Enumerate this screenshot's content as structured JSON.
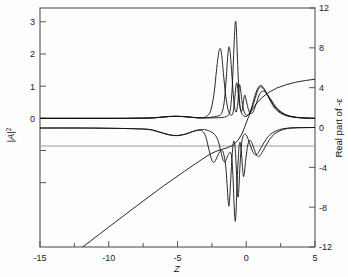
{
  "figure": {
    "background": "#fdfdfd",
    "frame_color": "#555555",
    "curve_color": "#111111",
    "zero_line_color": "#888888"
  },
  "chart_data": {
    "type": "line",
    "title": "",
    "xlabel": "Z",
    "ylabel": "|A|²",
    "y2label": "Real part of -ε",
    "xlim": [
      -15,
      5
    ],
    "ylim": [
      -4,
      3.43
    ],
    "y2lim": [
      -12,
      12
    ],
    "grid": false,
    "legend": "none",
    "xticks": [
      -15,
      -10,
      -5,
      0,
      5
    ],
    "xtick_labels": [
      "-15",
      "-10",
      "-5",
      "0",
      "5"
    ],
    "x_minor_ticks": [
      -12.5,
      -7.5,
      -2.5,
      2.5
    ],
    "yticks": [
      0,
      1,
      2,
      3
    ],
    "ytick_labels": [
      "0",
      "1",
      "2",
      "3"
    ],
    "y_minor_ticks": [
      -1,
      -2
    ],
    "y2ticks": [
      -12,
      -8,
      -4,
      0,
      4,
      8,
      12
    ],
    "y2tick_labels": [
      "-12",
      "-8",
      "-4",
      "0",
      "4",
      "8",
      "12"
    ],
    "series": [
      {
        "name": "intensity-1",
        "axis": "left",
        "points": [
          [
            -15,
            0.0
          ],
          [
            -13,
            0.0
          ],
          [
            -11,
            0.0
          ],
          [
            -9,
            0.0
          ],
          [
            -8,
            0.005
          ],
          [
            -7,
            0.01
          ],
          [
            -6.3,
            0.03
          ],
          [
            -5.6,
            0.055
          ],
          [
            -5.0,
            0.062
          ],
          [
            -4.4,
            0.05
          ],
          [
            -3.9,
            0.03
          ],
          [
            -3.5,
            0.018
          ],
          [
            -3.2,
            0.02
          ],
          [
            -2.9,
            0.06
          ],
          [
            -2.6,
            0.22
          ],
          [
            -2.35,
            0.75
          ],
          [
            -2.15,
            1.55
          ],
          [
            -2.0,
            2.05
          ],
          [
            -1.88,
            2.17
          ],
          [
            -1.78,
            1.95
          ],
          [
            -1.65,
            1.35
          ],
          [
            -1.5,
            0.72
          ],
          [
            -1.35,
            0.32
          ],
          [
            -1.2,
            0.14
          ],
          [
            -1.05,
            0.1
          ],
          [
            -0.95,
            0.2
          ],
          [
            -0.85,
            0.55
          ],
          [
            -0.75,
            1.0
          ],
          [
            -0.68,
            1.1
          ],
          [
            -0.6,
            0.85
          ],
          [
            -0.5,
            0.45
          ],
          [
            -0.38,
            0.2
          ],
          [
            -0.25,
            0.1
          ],
          [
            -0.1,
            0.06
          ],
          [
            0.05,
            0.07
          ],
          [
            0.2,
            0.14
          ],
          [
            0.4,
            0.35
          ],
          [
            0.6,
            0.66
          ],
          [
            0.8,
            0.9
          ],
          [
            0.95,
            1.0
          ],
          [
            1.1,
            1.02
          ],
          [
            1.3,
            0.92
          ],
          [
            1.55,
            0.72
          ],
          [
            1.8,
            0.5
          ],
          [
            2.1,
            0.3
          ],
          [
            2.5,
            0.16
          ],
          [
            3.0,
            0.07
          ],
          [
            3.6,
            0.03
          ],
          [
            4.2,
            0.01
          ],
          [
            5.0,
            0.0
          ]
        ]
      },
      {
        "name": "intensity-2",
        "axis": "left",
        "points": [
          [
            -15,
            0.0
          ],
          [
            -12,
            0.0
          ],
          [
            -9,
            0.0
          ],
          [
            -8,
            0.005
          ],
          [
            -7,
            0.012
          ],
          [
            -6.3,
            0.032
          ],
          [
            -5.6,
            0.058
          ],
          [
            -5.0,
            0.064
          ],
          [
            -4.4,
            0.05
          ],
          [
            -3.9,
            0.03
          ],
          [
            -3.5,
            0.017
          ],
          [
            -3.2,
            0.015
          ],
          [
            -2.9,
            0.018
          ],
          [
            -2.6,
            0.03
          ],
          [
            -2.3,
            0.05
          ],
          [
            -2.0,
            0.08
          ],
          [
            -1.8,
            0.15
          ],
          [
            -1.62,
            0.45
          ],
          [
            -1.48,
            1.1
          ],
          [
            -1.36,
            1.85
          ],
          [
            -1.28,
            2.2
          ],
          [
            -1.2,
            2.15
          ],
          [
            -1.12,
            1.8
          ],
          [
            -1.02,
            1.2
          ],
          [
            -0.92,
            0.62
          ],
          [
            -0.82,
            0.28
          ],
          [
            -0.72,
            0.2
          ],
          [
            -0.62,
            0.45
          ],
          [
            -0.54,
            0.9
          ],
          [
            -0.48,
            1.05
          ],
          [
            -0.4,
            0.85
          ],
          [
            -0.3,
            0.5
          ],
          [
            -0.18,
            0.24
          ],
          [
            -0.05,
            0.12
          ],
          [
            0.1,
            0.1
          ],
          [
            0.28,
            0.18
          ],
          [
            0.5,
            0.42
          ],
          [
            0.72,
            0.72
          ],
          [
            0.9,
            0.92
          ],
          [
            1.05,
            0.98
          ],
          [
            1.25,
            0.92
          ],
          [
            1.5,
            0.76
          ],
          [
            1.8,
            0.54
          ],
          [
            2.15,
            0.32
          ],
          [
            2.6,
            0.16
          ],
          [
            3.1,
            0.07
          ],
          [
            3.7,
            0.025
          ],
          [
            4.4,
            0.008
          ],
          [
            5.0,
            0.0
          ]
        ]
      },
      {
        "name": "intensity-3",
        "axis": "left",
        "points": [
          [
            -15,
            0.0
          ],
          [
            -11,
            0.0
          ],
          [
            -9,
            0.0
          ],
          [
            -8,
            0.004
          ],
          [
            -7,
            0.01
          ],
          [
            -6.3,
            0.03
          ],
          [
            -5.6,
            0.055
          ],
          [
            -5.0,
            0.06
          ],
          [
            -4.4,
            0.048
          ],
          [
            -3.9,
            0.028
          ],
          [
            -3.5,
            0.015
          ],
          [
            -3.2,
            0.012
          ],
          [
            -2.8,
            0.012
          ],
          [
            -2.4,
            0.015
          ],
          [
            -2.0,
            0.02
          ],
          [
            -1.7,
            0.03
          ],
          [
            -1.5,
            0.05
          ],
          [
            -1.3,
            0.1
          ],
          [
            -1.15,
            0.3
          ],
          [
            -1.02,
            0.95
          ],
          [
            -0.92,
            1.95
          ],
          [
            -0.84,
            2.7
          ],
          [
            -0.78,
            3.02
          ],
          [
            -0.72,
            2.8
          ],
          [
            -0.66,
            2.1
          ],
          [
            -0.58,
            1.25
          ],
          [
            -0.5,
            0.62
          ],
          [
            -0.42,
            0.3
          ],
          [
            -0.33,
            0.22
          ],
          [
            -0.25,
            0.35
          ],
          [
            -0.17,
            0.62
          ],
          [
            -0.1,
            0.72
          ],
          [
            -0.02,
            0.6
          ],
          [
            0.08,
            0.4
          ],
          [
            0.2,
            0.22
          ],
          [
            0.34,
            0.15
          ],
          [
            0.5,
            0.2
          ],
          [
            0.7,
            0.42
          ],
          [
            0.9,
            0.68
          ],
          [
            1.08,
            0.82
          ],
          [
            1.28,
            0.84
          ],
          [
            1.5,
            0.76
          ],
          [
            1.8,
            0.58
          ],
          [
            2.15,
            0.36
          ],
          [
            2.6,
            0.18
          ],
          [
            3.1,
            0.08
          ],
          [
            3.7,
            0.03
          ],
          [
            4.4,
            0.01
          ],
          [
            5.0,
            0.0
          ]
        ]
      },
      {
        "name": "epsilon-real-1",
        "axis": "right",
        "points": [
          [
            -15,
            -0.05
          ],
          [
            -12,
            -0.05
          ],
          [
            -10,
            -0.08
          ],
          [
            -8,
            -0.12
          ],
          [
            -7,
            -0.2
          ],
          [
            -6.3,
            -0.45
          ],
          [
            -5.6,
            -0.72
          ],
          [
            -5.0,
            -0.8
          ],
          [
            -4.4,
            -0.65
          ],
          [
            -3.9,
            -0.42
          ],
          [
            -3.5,
            -0.28
          ],
          [
            -3.2,
            -0.35
          ],
          [
            -2.95,
            -0.9
          ],
          [
            -2.7,
            -2.3
          ],
          [
            -2.5,
            -3.3
          ],
          [
            -2.35,
            -3.5
          ],
          [
            -2.2,
            -3.2
          ],
          [
            -2.0,
            -2.6
          ],
          [
            -1.8,
            -2.3
          ],
          [
            -1.65,
            -2.6
          ],
          [
            -1.5,
            -3.8
          ],
          [
            -1.4,
            -5.6
          ],
          [
            -1.32,
            -7.3
          ],
          [
            -1.26,
            -7.9
          ],
          [
            -1.2,
            -7.0
          ],
          [
            -1.12,
            -5.0
          ],
          [
            -1.03,
            -2.9
          ],
          [
            -0.95,
            -1.6
          ],
          [
            -0.88,
            -1.4
          ],
          [
            -0.8,
            -2.2
          ],
          [
            -0.72,
            -4.2
          ],
          [
            -0.66,
            -6.2
          ],
          [
            -0.6,
            -7.0
          ],
          [
            -0.54,
            -6.2
          ],
          [
            -0.47,
            -4.2
          ],
          [
            -0.38,
            -2.2
          ],
          [
            -0.28,
            -1.1
          ],
          [
            -0.15,
            -0.7
          ],
          [
            0.0,
            -0.75
          ],
          [
            0.15,
            -1.2
          ],
          [
            0.32,
            -1.9
          ],
          [
            0.5,
            -2.5
          ],
          [
            0.68,
            -2.75
          ],
          [
            0.85,
            -2.6
          ],
          [
            1.05,
            -2.1
          ],
          [
            1.3,
            -1.5
          ],
          [
            1.6,
            -0.9
          ],
          [
            1.95,
            -0.5
          ],
          [
            2.4,
            -0.22
          ],
          [
            2.9,
            -0.08
          ],
          [
            3.6,
            -0.02
          ],
          [
            5.0,
            0.0
          ]
        ]
      },
      {
        "name": "epsilon-real-2",
        "axis": "right",
        "points": [
          [
            -15,
            -0.05
          ],
          [
            -11,
            -0.06
          ],
          [
            -9,
            -0.1
          ],
          [
            -8,
            -0.14
          ],
          [
            -7,
            -0.22
          ],
          [
            -6.3,
            -0.48
          ],
          [
            -5.6,
            -0.75
          ],
          [
            -5.0,
            -0.82
          ],
          [
            -4.4,
            -0.66
          ],
          [
            -3.9,
            -0.4
          ],
          [
            -3.5,
            -0.25
          ],
          [
            -3.2,
            -0.2
          ],
          [
            -2.9,
            -0.25
          ],
          [
            -2.6,
            -0.4
          ],
          [
            -2.3,
            -0.7
          ],
          [
            -2.05,
            -1.3
          ],
          [
            -1.85,
            -2.4
          ],
          [
            -1.7,
            -3.2
          ],
          [
            -1.58,
            -3.45
          ],
          [
            -1.45,
            -3.2
          ],
          [
            -1.3,
            -2.7
          ],
          [
            -1.15,
            -2.5
          ],
          [
            -1.05,
            -3.1
          ],
          [
            -0.97,
            -4.8
          ],
          [
            -0.9,
            -7.2
          ],
          [
            -0.84,
            -8.9
          ],
          [
            -0.79,
            -9.4
          ],
          [
            -0.74,
            -8.4
          ],
          [
            -0.68,
            -6.1
          ],
          [
            -0.6,
            -3.6
          ],
          [
            -0.52,
            -1.9
          ],
          [
            -0.44,
            -1.5
          ],
          [
            -0.36,
            -2.3
          ],
          [
            -0.28,
            -3.9
          ],
          [
            -0.21,
            -4.9
          ],
          [
            -0.14,
            -4.6
          ],
          [
            -0.05,
            -3.4
          ],
          [
            0.08,
            -2.0
          ],
          [
            0.22,
            -1.3
          ],
          [
            0.4,
            -1.5
          ],
          [
            0.58,
            -2.2
          ],
          [
            0.78,
            -2.8
          ],
          [
            0.95,
            -2.9
          ],
          [
            1.15,
            -2.5
          ],
          [
            1.4,
            -1.9
          ],
          [
            1.7,
            -1.2
          ],
          [
            2.05,
            -0.65
          ],
          [
            2.5,
            -0.3
          ],
          [
            3.0,
            -0.1
          ],
          [
            3.7,
            -0.03
          ],
          [
            5.0,
            0.0
          ]
        ]
      },
      {
        "name": "epsilon-linear-ramp",
        "axis": "right",
        "points": [
          [
            -11.9,
            -12.0
          ],
          [
            -10,
            -10.0
          ],
          [
            -8,
            -7.9
          ],
          [
            -6,
            -5.85
          ],
          [
            -4.5,
            -4.4
          ],
          [
            -3.6,
            -3.55
          ],
          [
            -3.0,
            -3.0
          ],
          [
            -2.6,
            -2.65
          ],
          [
            -2.2,
            -2.4
          ],
          [
            -1.8,
            -2.2
          ],
          [
            -1.4,
            -2.05
          ],
          [
            -1.0,
            -1.8
          ],
          [
            -0.6,
            -1.3
          ],
          [
            -0.3,
            -0.6
          ],
          [
            -0.1,
            0.1
          ],
          [
            0.1,
            0.85
          ],
          [
            0.35,
            1.6
          ],
          [
            0.7,
            2.35
          ],
          [
            1.1,
            2.95
          ],
          [
            1.6,
            3.5
          ],
          [
            2.2,
            3.95
          ],
          [
            2.9,
            4.3
          ],
          [
            3.6,
            4.55
          ],
          [
            4.3,
            4.72
          ],
          [
            5.0,
            4.85
          ]
        ]
      }
    ]
  },
  "axes": {
    "x_axis_label": "Z",
    "y_axis_label_base": "|A|",
    "y_axis_label_exp": "2",
    "y2_axis_label": "Real part of -ε"
  }
}
